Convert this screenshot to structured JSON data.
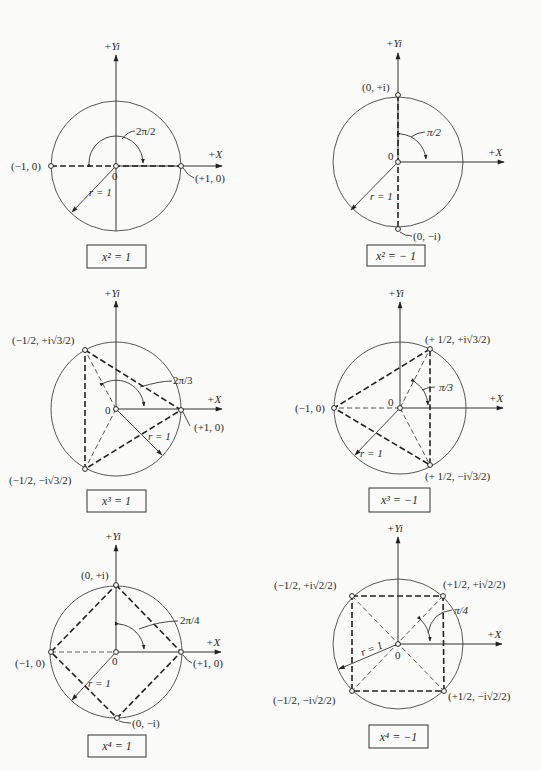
{
  "axes": {
    "y_label": "+Yi",
    "x_label": "+X",
    "origin_label": "0",
    "radius_label": "r = 1"
  },
  "diagrams": [
    {
      "id": "x2_eq_1",
      "equation": "x² = 1",
      "angle_label": "2π/2",
      "points": [
        "(−1, 0)",
        "(+1, 0)"
      ]
    },
    {
      "id": "x2_eq_neg1",
      "equation": "x² = − 1",
      "angle_label": "π/2",
      "points": [
        "(0, +i)",
        "(0, −i)"
      ]
    },
    {
      "id": "x3_eq_1",
      "equation": "x³ = 1",
      "angle_label": "2π/3",
      "points": [
        "(−1/2, +i√3/2)",
        "(+1, 0)",
        "(−1/2, −i√3/2)"
      ]
    },
    {
      "id": "x3_eq_neg1",
      "equation": "x³ = −1",
      "angle_label": "π/3",
      "points": [
        "(+ 1/2, +i√3/2)",
        "(−1, 0)",
        "(+ 1/2, −i√3/2)"
      ]
    },
    {
      "id": "x4_eq_1",
      "equation": "x⁴ = 1",
      "angle_label": "2π/4",
      "points": [
        "(0, +i)",
        "(−1, 0)",
        "(+1, 0)",
        "(0, −i)"
      ]
    },
    {
      "id": "x4_eq_neg1",
      "equation": "x⁴ = −1",
      "angle_label": "π/4",
      "points": [
        "(−1/2, +i√2/2)",
        "(+1/2, +i√2/2)",
        "(−1/2, −i√2/2)",
        "(+1/2, −i√2/2)"
      ]
    }
  ]
}
